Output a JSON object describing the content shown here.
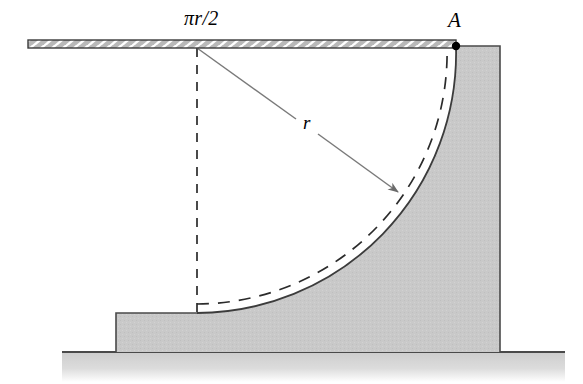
{
  "figure": {
    "labels": {
      "arc_length": "πr/2",
      "point_a": "A",
      "radius": "r"
    },
    "icons": {
      "radius_arrow": "radius-arrow-icon",
      "point_marker": "point-marker-dot-icon",
      "hatched_bar": "hatched-bar-icon",
      "ground_hatch": "ground-surface-icon"
    },
    "colors": {
      "body_fill": "#c9c9c9",
      "body_stroke": "#4a4a4a",
      "bar_fill": "#b8b8b8",
      "bar_stroke": "#3a3a3a",
      "ground_fill": "#cfcfcf",
      "ground_line": "#4a4a4a",
      "dashed_line": "#2b2b2b",
      "arrow_line": "#6b6b6b",
      "label_text": "#000000"
    },
    "geometry": {
      "bar": {
        "x_start": 28,
        "x_end": 456,
        "y_top": 40,
        "y_bottom": 48,
        "hatch_count": 20
      },
      "point_a": {
        "x": 456,
        "y": 46
      },
      "center": {
        "x": 197,
        "y": 48
      },
      "arc_radius": 260,
      "arc_start": {
        "x": 456,
        "y": 46
      },
      "arc_end": {
        "x": 197,
        "y": 313
      },
      "dashed_arc_offset": 9,
      "vertical_dashed_line": {
        "x": 197,
        "y_top": 48,
        "y_bottom": 313
      },
      "radius_arrow": {
        "x1": 197,
        "y1": 48,
        "x2": 398,
        "y2": 192
      },
      "pedestal": {
        "x_left": 116,
        "y_top": 313,
        "y_bottom": 352
      },
      "body_right_edge": {
        "x": 500,
        "y_top": 46,
        "y_bottom": 352
      },
      "ground": {
        "x_left": 62,
        "x_right": 565,
        "y": 352,
        "depth": 30
      }
    }
  }
}
